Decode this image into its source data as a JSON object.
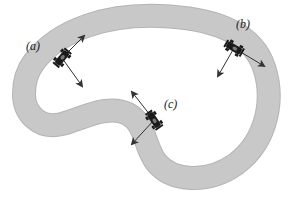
{
  "figure": {
    "track": {
      "color": "#c8c8c8",
      "shadow_color": "#b4b4b4",
      "width_px": 22,
      "path": "M 34 62 C 60 28, 110 14, 160 16 C 210 18, 248 30, 262 62 C 276 96, 268 140, 236 164 C 208 184, 172 182, 156 162 C 144 146, 146 124, 128 114 C 108 104, 84 118, 62 124 C 38 130, 24 112, 24 94 C 24 80, 28 70, 34 62 Z"
    },
    "cars": [
      {
        "id": "a",
        "label": "(a)",
        "x": 62,
        "y": 58,
        "angle": -50,
        "label_pos": {
          "x": 26,
          "y": 40
        },
        "velocity": {
          "dx": 22,
          "dy": -22
        },
        "acceleration": {
          "dx": 20,
          "dy": 28
        }
      },
      {
        "id": "b",
        "label": "(b)",
        "x": 234,
        "y": 48,
        "angle": 30,
        "label_pos": {
          "x": 236,
          "y": 18
        },
        "velocity": {
          "dx": 30,
          "dy": 18
        },
        "acceleration": {
          "dx": -16,
          "dy": 28
        }
      },
      {
        "id": "c",
        "label": "(c)",
        "x": 154,
        "y": 120,
        "angle": 55,
        "label_pos": {
          "x": 164,
          "y": 98
        },
        "velocity": {
          "dx": -22,
          "dy": -28
        },
        "acceleration": {
          "dx": -22,
          "dy": 24
        }
      }
    ],
    "arrow_color": "#333333",
    "car_color": "#1a1a1a"
  }
}
